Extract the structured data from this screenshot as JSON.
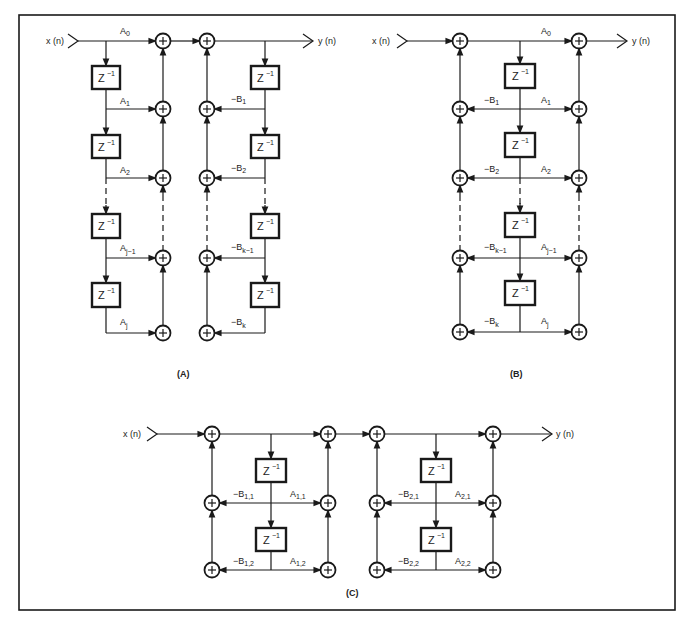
{
  "figure": {
    "frame_color": "#1a1a1a",
    "panels": [
      {
        "id": "A",
        "caption": "(A)",
        "input_label": "x (n)",
        "output_label": "y (n)",
        "delay_label": "Z",
        "delay_exp": "−1",
        "feedforward_coeffs": [
          {
            "base": "A",
            "sub": "0"
          },
          {
            "base": "A",
            "sub": "1"
          },
          {
            "base": "A",
            "sub": "2"
          },
          {
            "base": "A",
            "sub": "j−1"
          },
          {
            "base": "A",
            "sub": "j"
          }
        ],
        "feedback_coeffs": [
          {
            "base": "−B",
            "sub": "1"
          },
          {
            "base": "−B",
            "sub": "2"
          },
          {
            "base": "−B",
            "sub": "k−1"
          },
          {
            "base": "−B",
            "sub": "k"
          }
        ]
      },
      {
        "id": "B",
        "caption": "(B)",
        "input_label": "x (n)",
        "output_label": "y (n)",
        "delay_label": "Z",
        "delay_exp": "−1",
        "feedforward_coeffs": [
          {
            "base": "A",
            "sub": "0"
          },
          {
            "base": "A",
            "sub": "1"
          },
          {
            "base": "A",
            "sub": "2"
          },
          {
            "base": "A",
            "sub": "j−1"
          },
          {
            "base": "A",
            "sub": "j"
          }
        ],
        "feedback_coeffs": [
          {
            "base": "−B",
            "sub": "1"
          },
          {
            "base": "−B",
            "sub": "2"
          },
          {
            "base": "−B",
            "sub": "k−1"
          },
          {
            "base": "−B",
            "sub": "k"
          }
        ]
      },
      {
        "id": "C",
        "caption": "(C)",
        "input_label": "x (n)",
        "output_label": "y (n)",
        "delay_label": "Z",
        "delay_exp": "−1",
        "stage1": {
          "feedback": [
            {
              "base": "−B",
              "sub": "1,1"
            },
            {
              "base": "−B",
              "sub": "1,2"
            }
          ],
          "feedforward": [
            {
              "base": "A",
              "sub": "1,1"
            },
            {
              "base": "A",
              "sub": "1,2"
            }
          ]
        },
        "stage2": {
          "feedback": [
            {
              "base": "−B",
              "sub": "2,1"
            },
            {
              "base": "−B",
              "sub": "2,2"
            }
          ],
          "feedforward": [
            {
              "base": "A",
              "sub": "2,1"
            },
            {
              "base": "A",
              "sub": "2,2"
            }
          ]
        }
      }
    ],
    "summer_symbol": "+"
  }
}
